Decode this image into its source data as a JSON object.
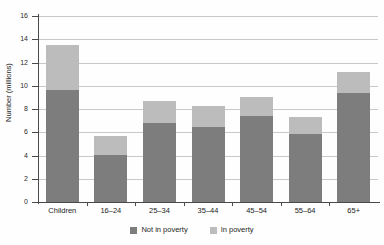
{
  "chart_data": {
    "type": "bar",
    "title": "",
    "subtitle": "",
    "xlabel": "",
    "ylabel": "Number (millions)",
    "ylim": [
      0,
      16
    ],
    "yticks": [
      0,
      2,
      4,
      6,
      8,
      10,
      12,
      14,
      16
    ],
    "ytick_labels": [
      "0",
      "2",
      "4",
      "6",
      "8",
      "10",
      "12",
      "14",
      "16"
    ],
    "grid": true,
    "stacked": true,
    "legend_position": "bottom",
    "categories": [
      "Children",
      "16–24",
      "25–34",
      "35–44",
      "45–54",
      "55–64",
      "65+"
    ],
    "series": [
      {
        "name": "Not in poverty",
        "color": "#7d7d7d",
        "values": [
          9.6,
          4.05,
          6.8,
          6.45,
          7.4,
          5.85,
          9.4
        ]
      },
      {
        "name": "In poverty",
        "color": "#bcbcbc",
        "values": [
          3.9,
          1.6,
          1.9,
          1.85,
          1.6,
          1.45,
          1.8
        ]
      }
    ],
    "totals": [
      13.5,
      5.65,
      8.7,
      8.3,
      9.0,
      7.3,
      11.2
    ]
  },
  "legend": {
    "items": [
      {
        "label": "Not in poverty",
        "color": "#7d7d7d"
      },
      {
        "label": "In poverty",
        "color": "#bcbcbc"
      }
    ]
  }
}
